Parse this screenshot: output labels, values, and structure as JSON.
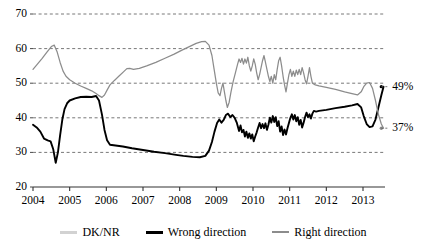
{
  "chart_data": {
    "type": "line",
    "title": "",
    "subtitle": "",
    "xlabel": "",
    "ylabel": "",
    "xlim": [
      2004.0,
      2013.6
    ],
    "ylim": [
      20,
      70
    ],
    "yticks": [
      20,
      30,
      40,
      50,
      60,
      70
    ],
    "xticks": [
      2004,
      2005,
      2006,
      2007,
      2008,
      2009,
      2010,
      2011,
      2012,
      2013
    ],
    "grid": "horizontal-dashed",
    "legend_position": "bottom-center",
    "annotations": [
      {
        "text": "49%",
        "series": "Wrong direction",
        "x": 2013.5,
        "y": 49
      },
      {
        "text": "37%",
        "series": "Right direction",
        "x": 2013.5,
        "y": 37
      }
    ],
    "series": [
      {
        "name": "DK/NR",
        "color": "#d2d2d2",
        "points": []
      },
      {
        "name": "Wrong direction",
        "color": "#000000",
        "points": [
          [
            2004.0,
            38.0
          ],
          [
            2004.1,
            37.2
          ],
          [
            2004.2,
            36.0
          ],
          [
            2004.3,
            34.0
          ],
          [
            2004.4,
            33.5
          ],
          [
            2004.48,
            33.2
          ],
          [
            2004.55,
            31.0
          ],
          [
            2004.62,
            27.0
          ],
          [
            2004.68,
            30.0
          ],
          [
            2004.74,
            35.0
          ],
          [
            2004.8,
            39.5
          ],
          [
            2004.86,
            42.5
          ],
          [
            2004.93,
            44.2
          ],
          [
            2005.0,
            45.0
          ],
          [
            2005.15,
            45.6
          ],
          [
            2005.3,
            46.0
          ],
          [
            2005.45,
            46.1
          ],
          [
            2005.6,
            46.0
          ],
          [
            2005.72,
            46.3
          ],
          [
            2005.8,
            45.0
          ],
          [
            2005.88,
            41.0
          ],
          [
            2005.95,
            36.5
          ],
          [
            2006.02,
            33.5
          ],
          [
            2006.1,
            32.2
          ],
          [
            2006.25,
            32.0
          ],
          [
            2006.45,
            31.7
          ],
          [
            2006.7,
            31.2
          ],
          [
            2007.0,
            30.7
          ],
          [
            2007.3,
            30.2
          ],
          [
            2007.6,
            29.8
          ],
          [
            2007.9,
            29.3
          ],
          [
            2008.1,
            29.0
          ],
          [
            2008.35,
            28.7
          ],
          [
            2008.55,
            28.6
          ],
          [
            2008.7,
            29.0
          ],
          [
            2008.8,
            30.5
          ],
          [
            2008.88,
            33.0
          ],
          [
            2008.95,
            36.0
          ],
          [
            2009.02,
            38.5
          ],
          [
            2009.08,
            39.5
          ],
          [
            2009.14,
            38.6
          ],
          [
            2009.2,
            39.4
          ],
          [
            2009.26,
            40.8
          ],
          [
            2009.32,
            41.2
          ],
          [
            2009.38,
            40.2
          ],
          [
            2009.44,
            40.8
          ],
          [
            2009.5,
            40.0
          ],
          [
            2009.56,
            38.5
          ],
          [
            2009.62,
            36.2
          ],
          [
            2009.66,
            37.8
          ],
          [
            2009.7,
            35.8
          ],
          [
            2009.74,
            36.5
          ],
          [
            2009.78,
            34.6
          ],
          [
            2009.82,
            36.0
          ],
          [
            2009.86,
            34.2
          ],
          [
            2009.9,
            35.5
          ],
          [
            2009.94,
            34.0
          ],
          [
            2009.98,
            35.2
          ],
          [
            2010.02,
            33.2
          ],
          [
            2010.06,
            34.6
          ],
          [
            2010.1,
            35.8
          ],
          [
            2010.14,
            37.2
          ],
          [
            2010.18,
            38.5
          ],
          [
            2010.22,
            37.0
          ],
          [
            2010.26,
            38.2
          ],
          [
            2010.3,
            37.0
          ],
          [
            2010.34,
            38.4
          ],
          [
            2010.38,
            36.5
          ],
          [
            2010.42,
            38.0
          ],
          [
            2010.46,
            40.0
          ],
          [
            2010.5,
            38.6
          ],
          [
            2010.54,
            40.5
          ],
          [
            2010.58,
            38.8
          ],
          [
            2010.62,
            40.2
          ],
          [
            2010.66,
            37.6
          ],
          [
            2010.7,
            39.0
          ],
          [
            2010.74,
            36.0
          ],
          [
            2010.78,
            37.5
          ],
          [
            2010.82,
            35.0
          ],
          [
            2010.86,
            36.6
          ],
          [
            2010.9,
            35.2
          ],
          [
            2010.94,
            37.0
          ],
          [
            2010.98,
            38.5
          ],
          [
            2011.02,
            40.0
          ],
          [
            2011.06,
            41.0
          ],
          [
            2011.1,
            39.5
          ],
          [
            2011.14,
            40.8
          ],
          [
            2011.18,
            39.0
          ],
          [
            2011.22,
            40.2
          ],
          [
            2011.26,
            38.0
          ],
          [
            2011.3,
            39.4
          ],
          [
            2011.34,
            37.2
          ],
          [
            2011.38,
            38.6
          ],
          [
            2011.42,
            40.2
          ],
          [
            2011.46,
            41.5
          ],
          [
            2011.5,
            40.2
          ],
          [
            2011.54,
            41.0
          ],
          [
            2011.58,
            39.8
          ],
          [
            2011.62,
            41.2
          ],
          [
            2011.66,
            42.0
          ],
          [
            2011.72,
            41.8
          ],
          [
            2011.8,
            42.0
          ],
          [
            2012.0,
            42.3
          ],
          [
            2012.25,
            42.8
          ],
          [
            2012.5,
            43.2
          ],
          [
            2012.7,
            43.6
          ],
          [
            2012.85,
            44.0
          ],
          [
            2012.95,
            43.0
          ],
          [
            2013.02,
            40.5
          ],
          [
            2013.1,
            38.2
          ],
          [
            2013.18,
            37.3
          ],
          [
            2013.26,
            37.5
          ],
          [
            2013.34,
            39.5
          ],
          [
            2013.42,
            43.0
          ],
          [
            2013.5,
            46.5
          ],
          [
            2013.56,
            49.0
          ]
        ]
      },
      {
        "name": "Right direction",
        "color": "#8c8c8c",
        "points": [
          [
            2004.0,
            54.0
          ],
          [
            2004.12,
            55.5
          ],
          [
            2004.25,
            57.2
          ],
          [
            2004.38,
            59.0
          ],
          [
            2004.5,
            60.6
          ],
          [
            2004.58,
            61.0
          ],
          [
            2004.66,
            59.0
          ],
          [
            2004.74,
            56.0
          ],
          [
            2004.82,
            53.5
          ],
          [
            2004.9,
            52.0
          ],
          [
            2005.0,
            51.0
          ],
          [
            2005.15,
            50.0
          ],
          [
            2005.3,
            49.2
          ],
          [
            2005.45,
            48.5
          ],
          [
            2005.6,
            47.8
          ],
          [
            2005.72,
            47.0
          ],
          [
            2005.8,
            46.4
          ],
          [
            2005.88,
            45.9
          ],
          [
            2005.95,
            46.6
          ],
          [
            2006.02,
            48.0
          ],
          [
            2006.1,
            49.5
          ],
          [
            2006.22,
            50.8
          ],
          [
            2006.34,
            52.0
          ],
          [
            2006.46,
            53.2
          ],
          [
            2006.56,
            54.2
          ],
          [
            2006.64,
            54.3
          ],
          [
            2006.74,
            54.0
          ],
          [
            2006.9,
            54.3
          ],
          [
            2007.1,
            55.0
          ],
          [
            2007.35,
            56.0
          ],
          [
            2007.6,
            57.2
          ],
          [
            2007.85,
            58.4
          ],
          [
            2008.05,
            59.5
          ],
          [
            2008.25,
            60.5
          ],
          [
            2008.45,
            61.5
          ],
          [
            2008.6,
            62.0
          ],
          [
            2008.7,
            62.1
          ],
          [
            2008.8,
            61.0
          ],
          [
            2008.88,
            58.0
          ],
          [
            2008.94,
            54.0
          ],
          [
            2009.0,
            50.0
          ],
          [
            2009.05,
            47.2
          ],
          [
            2009.1,
            46.4
          ],
          [
            2009.14,
            48.5
          ],
          [
            2009.18,
            50.0
          ],
          [
            2009.22,
            47.5
          ],
          [
            2009.26,
            45.0
          ],
          [
            2009.3,
            43.0
          ],
          [
            2009.35,
            44.5
          ],
          [
            2009.4,
            47.5
          ],
          [
            2009.46,
            50.5
          ],
          [
            2009.52,
            53.0
          ],
          [
            2009.58,
            55.5
          ],
          [
            2009.62,
            57.0
          ],
          [
            2009.66,
            56.0
          ],
          [
            2009.7,
            57.2
          ],
          [
            2009.74,
            55.5
          ],
          [
            2009.78,
            57.0
          ],
          [
            2009.82,
            55.8
          ],
          [
            2009.86,
            57.5
          ],
          [
            2009.9,
            55.0
          ],
          [
            2009.94,
            53.5
          ],
          [
            2009.98,
            55.0
          ],
          [
            2010.02,
            57.0
          ],
          [
            2010.06,
            55.5
          ],
          [
            2010.1,
            53.0
          ],
          [
            2010.14,
            51.0
          ],
          [
            2010.18,
            52.5
          ],
          [
            2010.22,
            54.5
          ],
          [
            2010.26,
            56.5
          ],
          [
            2010.3,
            58.0
          ],
          [
            2010.34,
            56.0
          ],
          [
            2010.38,
            54.0
          ],
          [
            2010.42,
            52.0
          ],
          [
            2010.46,
            50.5
          ],
          [
            2010.5,
            52.0
          ],
          [
            2010.54,
            50.0
          ],
          [
            2010.58,
            52.5
          ],
          [
            2010.62,
            51.0
          ],
          [
            2010.66,
            54.0
          ],
          [
            2010.7,
            56.5
          ],
          [
            2010.74,
            57.5
          ],
          [
            2010.78,
            55.0
          ],
          [
            2010.82,
            52.0
          ],
          [
            2010.86,
            49.5
          ],
          [
            2010.9,
            47.5
          ],
          [
            2010.94,
            50.0
          ],
          [
            2010.98,
            52.5
          ],
          [
            2011.02,
            54.0
          ],
          [
            2011.06,
            52.0
          ],
          [
            2011.1,
            53.5
          ],
          [
            2011.14,
            52.0
          ],
          [
            2011.18,
            53.8
          ],
          [
            2011.22,
            52.5
          ],
          [
            2011.26,
            54.0
          ],
          [
            2011.3,
            52.5
          ],
          [
            2011.34,
            54.5
          ],
          [
            2011.38,
            53.0
          ],
          [
            2011.42,
            51.0
          ],
          [
            2011.46,
            49.8
          ],
          [
            2011.5,
            52.0
          ],
          [
            2011.54,
            54.5
          ],
          [
            2011.58,
            52.0
          ],
          [
            2011.62,
            50.0
          ],
          [
            2011.7,
            49.5
          ],
          [
            2011.8,
            49.2
          ],
          [
            2012.0,
            48.8
          ],
          [
            2012.25,
            48.2
          ],
          [
            2012.5,
            47.5
          ],
          [
            2012.7,
            47.0
          ],
          [
            2012.85,
            46.6
          ],
          [
            2012.95,
            47.5
          ],
          [
            2013.02,
            49.0
          ],
          [
            2013.1,
            50.0
          ],
          [
            2013.18,
            50.2
          ],
          [
            2013.26,
            48.5
          ],
          [
            2013.34,
            45.0
          ],
          [
            2013.42,
            41.0
          ],
          [
            2013.5,
            38.2
          ],
          [
            2013.56,
            37.0
          ]
        ]
      }
    ]
  },
  "axis": {
    "y_labels": [
      "70",
      "60",
      "50",
      "40",
      "30",
      "20"
    ],
    "x_labels": [
      "2004",
      "2005",
      "2006",
      "2007",
      "2008",
      "2009",
      "2010",
      "2011",
      "2012",
      "2013"
    ]
  },
  "legend": {
    "items": [
      {
        "label": "DK/NR",
        "color": "#d2d2d2"
      },
      {
        "label": "Wrong direction",
        "color": "#000000"
      },
      {
        "label": "Right direction",
        "color": "#8c8c8c"
      }
    ]
  },
  "endpoint_labels": {
    "top": "49%",
    "bottom": "37%"
  }
}
